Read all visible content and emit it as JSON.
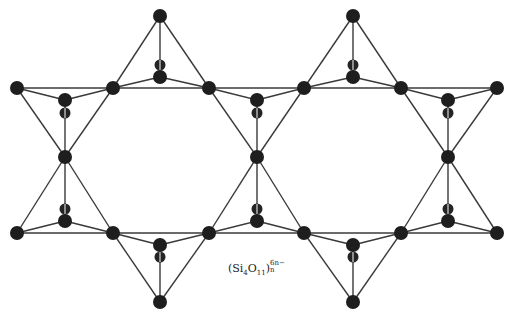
{
  "diagram": {
    "title": "",
    "formula": {
      "open": "(Si",
      "si_subscript": "4",
      "o": "O",
      "o_subscript": "11",
      "close": ")",
      "charge_superscript": "6n−",
      "n_subscript": "n"
    },
    "colors": {
      "atom": "#1e1e1e",
      "edge": "#3a3a3a",
      "background": "#ffffff"
    },
    "atoms": [
      {
        "id": "apex-top-1",
        "x": 160,
        "y": 16
      },
      {
        "id": "apex-top-2",
        "x": 353,
        "y": 16
      },
      {
        "id": "u-outer-left",
        "x": 17,
        "y": 88
      },
      {
        "id": "u-1",
        "x": 113,
        "y": 88
      },
      {
        "id": "u-2",
        "x": 209,
        "y": 88
      },
      {
        "id": "u-3",
        "x": 304,
        "y": 88
      },
      {
        "id": "u-4",
        "x": 401,
        "y": 88
      },
      {
        "id": "u-outer-right",
        "x": 497,
        "y": 88
      },
      {
        "id": "ut-c1",
        "x": 160,
        "y": 77
      },
      {
        "id": "ut-c2",
        "x": 353,
        "y": 77
      },
      {
        "id": "ud-c1",
        "x": 65,
        "y": 100
      },
      {
        "id": "ud-c2",
        "x": 257,
        "y": 100
      },
      {
        "id": "ud-c3",
        "x": 448,
        "y": 100
      },
      {
        "id": "mid-1",
        "x": 65,
        "y": 157
      },
      {
        "id": "mid-2",
        "x": 257,
        "y": 157
      },
      {
        "id": "mid-3",
        "x": 448,
        "y": 157
      },
      {
        "id": "lu-c1",
        "x": 65,
        "y": 221
      },
      {
        "id": "lu-c2",
        "x": 257,
        "y": 221
      },
      {
        "id": "lu-c3",
        "x": 448,
        "y": 221
      },
      {
        "id": "l-outer-left",
        "x": 17,
        "y": 233
      },
      {
        "id": "l-1",
        "x": 113,
        "y": 233
      },
      {
        "id": "l-2",
        "x": 209,
        "y": 233
      },
      {
        "id": "l-3",
        "x": 304,
        "y": 233
      },
      {
        "id": "l-4",
        "x": 401,
        "y": 233
      },
      {
        "id": "l-outer-right",
        "x": 497,
        "y": 233
      },
      {
        "id": "ld-c1",
        "x": 160,
        "y": 245
      },
      {
        "id": "ld-c2",
        "x": 353,
        "y": 245
      },
      {
        "id": "apex-bot-1",
        "x": 160,
        "y": 302
      },
      {
        "id": "apex-bot-2",
        "x": 353,
        "y": 302
      }
    ],
    "hidden_atoms": [
      {
        "x": 160,
        "y": 65
      },
      {
        "x": 353,
        "y": 65
      },
      {
        "x": 65,
        "y": 113
      },
      {
        "x": 257,
        "y": 113
      },
      {
        "x": 448,
        "y": 113
      },
      {
        "x": 65,
        "y": 209
      },
      {
        "x": 257,
        "y": 209
      },
      {
        "x": 448,
        "y": 209
      },
      {
        "x": 160,
        "y": 257
      },
      {
        "x": 353,
        "y": 257
      }
    ],
    "edges": [
      [
        "u-outer-left",
        "u-outer-right"
      ],
      [
        "l-outer-left",
        "l-outer-right"
      ],
      [
        "apex-top-1",
        "u-1"
      ],
      [
        "apex-top-1",
        "u-2"
      ],
      [
        "apex-top-1",
        "ut-c1"
      ],
      [
        "ut-c1",
        "u-1"
      ],
      [
        "ut-c1",
        "u-2"
      ],
      [
        "apex-top-2",
        "u-3"
      ],
      [
        "apex-top-2",
        "u-4"
      ],
      [
        "apex-top-2",
        "ut-c2"
      ],
      [
        "ut-c2",
        "u-3"
      ],
      [
        "ut-c2",
        "u-4"
      ],
      [
        "u-outer-left",
        "ud-c1"
      ],
      [
        "ud-c1",
        "u-1"
      ],
      [
        "u-outer-left",
        "mid-1"
      ],
      [
        "u-1",
        "mid-1"
      ],
      [
        "ud-c1",
        "mid-1"
      ],
      [
        "u-2",
        "ud-c2"
      ],
      [
        "ud-c2",
        "u-3"
      ],
      [
        "u-2",
        "mid-2"
      ],
      [
        "u-3",
        "mid-2"
      ],
      [
        "ud-c2",
        "mid-2"
      ],
      [
        "u-4",
        "ud-c3"
      ],
      [
        "ud-c3",
        "u-outer-right"
      ],
      [
        "u-4",
        "mid-3"
      ],
      [
        "u-outer-right",
        "mid-3"
      ],
      [
        "ud-c3",
        "mid-3"
      ],
      [
        "mid-1",
        "l-outer-left"
      ],
      [
        "mid-1",
        "l-1"
      ],
      [
        "mid-1",
        "lu-c1"
      ],
      [
        "lu-c1",
        "l-outer-left"
      ],
      [
        "lu-c1",
        "l-1"
      ],
      [
        "mid-2",
        "l-2"
      ],
      [
        "mid-2",
        "l-3"
      ],
      [
        "mid-2",
        "lu-c2"
      ],
      [
        "lu-c2",
        "l-2"
      ],
      [
        "lu-c2",
        "l-3"
      ],
      [
        "mid-3",
        "l-4"
      ],
      [
        "mid-3",
        "l-outer-right"
      ],
      [
        "mid-3",
        "lu-c3"
      ],
      [
        "lu-c3",
        "l-4"
      ],
      [
        "lu-c3",
        "l-outer-right"
      ],
      [
        "l-1",
        "ld-c1"
      ],
      [
        "ld-c1",
        "l-2"
      ],
      [
        "l-1",
        "apex-bot-1"
      ],
      [
        "l-2",
        "apex-bot-1"
      ],
      [
        "ld-c1",
        "apex-bot-1"
      ],
      [
        "l-3",
        "ld-c2"
      ],
      [
        "ld-c2",
        "l-4"
      ],
      [
        "l-3",
        "apex-bot-2"
      ],
      [
        "l-4",
        "apex-bot-2"
      ],
      [
        "ld-c2",
        "apex-bot-2"
      ]
    ]
  }
}
